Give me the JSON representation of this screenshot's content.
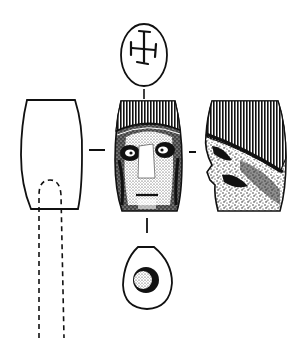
{
  "figure": {
    "subject": "bead-with-face",
    "views": [
      {
        "id": "section",
        "label": "section-view"
      },
      {
        "id": "top",
        "label": "top-view-cross-mark"
      },
      {
        "id": "front",
        "label": "front-view-face"
      },
      {
        "id": "profile",
        "label": "side-view-profile"
      },
      {
        "id": "bottom",
        "label": "bottom-view-perforation"
      }
    ],
    "colors": {
      "ink": "#111111",
      "paper": "#ffffff"
    }
  }
}
